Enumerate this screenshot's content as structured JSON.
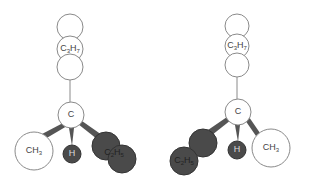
{
  "figure": {
    "colors": {
      "open_atom": "#ffffff",
      "dark_atom": "#4a4a4a",
      "outline": "#8a8a8a",
      "wedge": "#555555"
    }
  },
  "molecules": [
    {
      "name": "left-enantiomer",
      "groups": {
        "top": {
          "label": "C",
          "sub1": "3",
          "label2": "H",
          "sub2": "7"
        },
        "center": {
          "label": "C"
        },
        "left": {
          "label": "CH",
          "sub": "3"
        },
        "middle": {
          "label": "H"
        },
        "right": {
          "label": "C",
          "sub1": "2",
          "label2": "H",
          "sub2": "5"
        }
      }
    },
    {
      "name": "right-enantiomer",
      "groups": {
        "top": {
          "label": "C",
          "sub1": "3",
          "label2": "H",
          "sub2": "7"
        },
        "center": {
          "label": "C"
        },
        "left": {
          "label": "C",
          "sub1": "2",
          "label2": "H",
          "sub2": "5"
        },
        "middle": {
          "label": "H"
        },
        "right": {
          "label": "CH",
          "sub": "3"
        }
      }
    }
  ]
}
